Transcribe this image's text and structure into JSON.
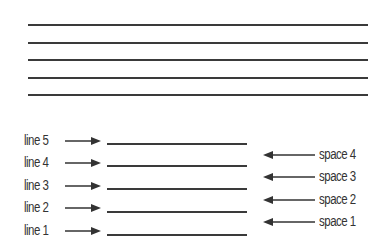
{
  "staff": {
    "line_count": 5,
    "color": "#3a3a3a"
  },
  "labeled_staff": {
    "lines": [
      {
        "label": "line 5"
      },
      {
        "label": "line 4"
      },
      {
        "label": "line 3"
      },
      {
        "label": "line 2"
      },
      {
        "label": "line 1"
      }
    ],
    "spaces": [
      {
        "label": "space 4"
      },
      {
        "label": "space 3"
      },
      {
        "label": "space 2"
      },
      {
        "label": "space 1"
      }
    ]
  }
}
